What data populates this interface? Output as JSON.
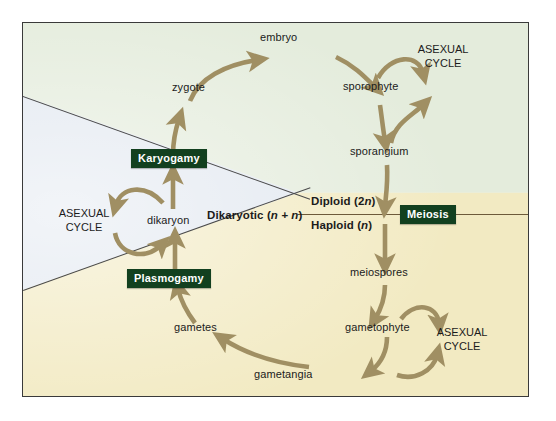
{
  "figure": {
    "frame_border_color": "#3a3a3a",
    "arrow_color": "#a08f63",
    "chip_color": "#12401f",
    "chip_text_color": "#ffffff"
  },
  "regions": [
    {
      "name": "diploid-green-region",
      "color": "#e4ecdc",
      "label": "Diploid (2n)"
    },
    {
      "name": "haploid-yellow-region",
      "color": "#f2eac2",
      "label": "Haploid (n)"
    },
    {
      "name": "dikaryotic-blue-region",
      "color": "#e2e8f0",
      "label": "Dikaryotic (n + n)"
    }
  ],
  "ploidy_labels": {
    "diploid": "Diploid (2",
    "diploid_italic": "n",
    "diploid_tail": ")",
    "haploid": "Haploid (",
    "haploid_italic": "n",
    "haploid_tail": ")",
    "dikaryotic": "Dikaryotic (",
    "dikaryotic_italic": "n + n",
    "dikaryotic_tail": ")"
  },
  "process_chips": [
    {
      "name": "karyogamy-chip",
      "label": "Karyogamy"
    },
    {
      "name": "plasmogamy-chip",
      "label": "Plasmogamy"
    },
    {
      "name": "meiosis-chip",
      "label": "Meiosis"
    }
  ],
  "stage_labels": [
    {
      "name": "embryo-label",
      "label": "embryo"
    },
    {
      "name": "zygote-label",
      "label": "zygote"
    },
    {
      "name": "sporophyte-label",
      "label": "sporophyte"
    },
    {
      "name": "sporangium-label",
      "label": "sporangium"
    },
    {
      "name": "meiospores-label",
      "label": "meiospores"
    },
    {
      "name": "gametophyte-label",
      "label": "gametophyte"
    },
    {
      "name": "gametangia-label",
      "label": "gametangia"
    },
    {
      "name": "gametes-label",
      "label": "gametes"
    },
    {
      "name": "dikaryon-label",
      "label": "dikaryon"
    }
  ],
  "asexual_cycles": [
    {
      "name": "asexual-cycle-sporophyte",
      "line1": "ASEXUAL",
      "line2": "CYCLE"
    },
    {
      "name": "asexual-cycle-dikaryon",
      "line1": "ASEXUAL",
      "line2": "CYCLE"
    },
    {
      "name": "asexual-cycle-gametophyte",
      "line1": "ASEXUAL",
      "line2": "CYCLE"
    }
  ]
}
